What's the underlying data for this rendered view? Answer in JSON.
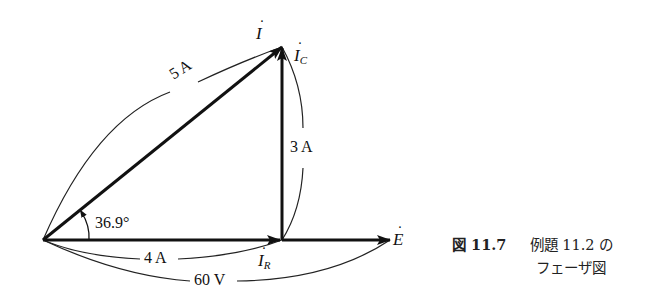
{
  "diagram": {
    "type": "phasor-diagram",
    "origin": [
      43,
      240
    ],
    "phasors": [
      {
        "name": "I",
        "label": "İ",
        "magnitude_label": "5 A",
        "from": [
          43,
          240
        ],
        "to": [
          282,
          47
        ]
      },
      {
        "name": "I_C",
        "label": "İ",
        "subscript": "C",
        "magnitude_label": "3 A",
        "from": [
          282,
          240
        ],
        "to": [
          282,
          47
        ]
      },
      {
        "name": "I_R",
        "label": "İ",
        "subscript": "R",
        "magnitude_label": "4 A",
        "from": [
          43,
          240
        ],
        "to": [
          282,
          240
        ]
      },
      {
        "name": "E",
        "label": "Ė",
        "magnitude_label": "60 V",
        "from": [
          43,
          240
        ],
        "to": [
          390,
          240
        ]
      }
    ],
    "angle_label": "36.9°"
  },
  "labels": {
    "I": "I",
    "I_C": "I",
    "I_C_sub": "C",
    "I_R": "I",
    "I_R_sub": "R",
    "E": "E",
    "dot": "·",
    "mag_I": "5 A",
    "mag_IC": "3 A",
    "mag_IR": "4 A",
    "mag_E": "60 V",
    "angle": "36.9°"
  },
  "caption": {
    "figure_number": "図 11.7",
    "line1": "例題 11.2 の",
    "line2": "フェーザ図"
  }
}
